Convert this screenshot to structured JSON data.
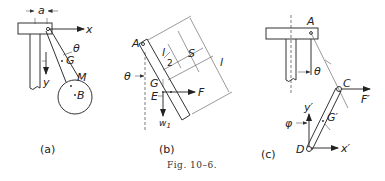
{
  "figure": {
    "caption": "Fig. 10–6.",
    "panels": [
      {
        "id": "a",
        "sublabel": "(a)",
        "labels": {
          "dimension": "a",
          "x_axis": "x",
          "y_axis": "y",
          "angle": "θ",
          "center_of_gravity": "G",
          "mass": "M",
          "point": "B"
        }
      },
      {
        "id": "b",
        "sublabel": "(b)",
        "labels": {
          "pivot": "A",
          "angle": "θ",
          "half_length_num": "l",
          "half_length_den": "2",
          "distance": "S",
          "length": "l",
          "center_of_gravity": "G",
          "force_point": "E",
          "force": "F",
          "weight": "w",
          "weight_sub": "1"
        }
      },
      {
        "id": "c",
        "sublabel": "(c)",
        "labels": {
          "pivot": "A",
          "angle_theta": "θ",
          "joint": "C",
          "force": "F′",
          "y_axis": "y′",
          "angle_phi": "φ",
          "center_of_gravity": "G′",
          "lower_end": "D",
          "x_axis": "x′"
        }
      }
    ]
  }
}
